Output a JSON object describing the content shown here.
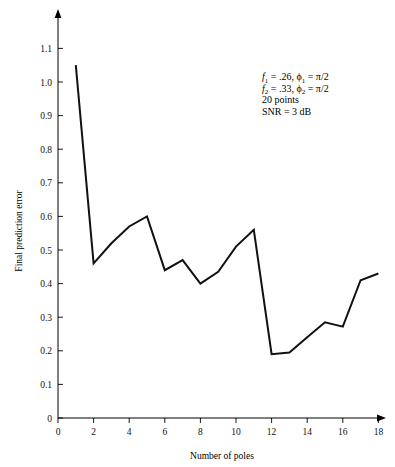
{
  "chart_data": {
    "type": "line",
    "title": "",
    "xlabel": "Number of poles",
    "ylabel": "Final prediction error",
    "x": [
      1,
      2,
      3,
      4,
      5,
      6,
      7,
      8,
      9,
      10,
      11,
      12,
      13,
      14,
      15,
      16,
      17,
      18
    ],
    "values": [
      1.05,
      0.46,
      0.52,
      0.57,
      0.6,
      0.44,
      0.47,
      0.4,
      0.435,
      0.51,
      0.56,
      0.19,
      0.195,
      0.24,
      0.285,
      0.272,
      0.41,
      0.43
    ],
    "series": [
      {
        "name": "Final prediction error",
        "values": [
          1.05,
          0.46,
          0.52,
          0.57,
          0.6,
          0.44,
          0.47,
          0.4,
          0.435,
          0.51,
          0.56,
          0.19,
          0.195,
          0.24,
          0.285,
          0.272,
          0.41,
          0.43
        ]
      }
    ],
    "xlim": [
      0,
      18.9
    ],
    "ylim": [
      0,
      1.16
    ],
    "xticks": [
      0,
      2,
      4,
      6,
      8,
      10,
      12,
      14,
      16,
      18
    ],
    "xtick_labels": [
      "0",
      "2",
      "4",
      "6",
      "8",
      "10",
      "12",
      "14",
      "16",
      "18"
    ],
    "yticks": [
      0,
      0.1,
      0.2,
      0.3,
      0.4,
      0.5,
      0.6,
      0.7,
      0.8,
      0.9,
      1.0,
      1.1
    ],
    "ytick_labels": [
      "0",
      "0.1",
      "0.2",
      "0.3",
      "0.4",
      "0.5",
      "0.6",
      "0.7",
      "0.8",
      "0.9",
      "1.0",
      "1.1"
    ],
    "grid": false,
    "legend": "none",
    "line_color": "#111111",
    "axis_color": "#000000",
    "background": "#ffffff",
    "annotations": [
      "f1 = .26, ϕ1 = π/2",
      "f2 = .33, ϕ2 = π/2",
      "20 points",
      "SNR = 3 dB"
    ]
  },
  "annotation": {
    "line1": {
      "var": "f",
      "var_sub": "1",
      "eq1": " = .26, ",
      "phi": "ϕ",
      "phi_sub": "1",
      "eq2": " = π/2"
    },
    "line2": {
      "var": "f",
      "var_sub": "2",
      "eq1": " = .33, ",
      "phi": "ϕ",
      "phi_sub": "2",
      "eq2": " = π/2"
    },
    "line3": "20 points",
    "line4": "SNR = 3 dB"
  },
  "axes": {
    "x_title": "Number of poles",
    "y_title": "Final prediction error"
  },
  "xtick_labels": [
    "0",
    "2",
    "4",
    "6",
    "8",
    "10",
    "12",
    "14",
    "16",
    "18"
  ],
  "ytick_labels": [
    "0",
    "0.1",
    "0.2",
    "0.3",
    "0.4",
    "0.5",
    "0.6",
    "0.7",
    "0.8",
    "0.9",
    "1.0",
    "1.1"
  ]
}
